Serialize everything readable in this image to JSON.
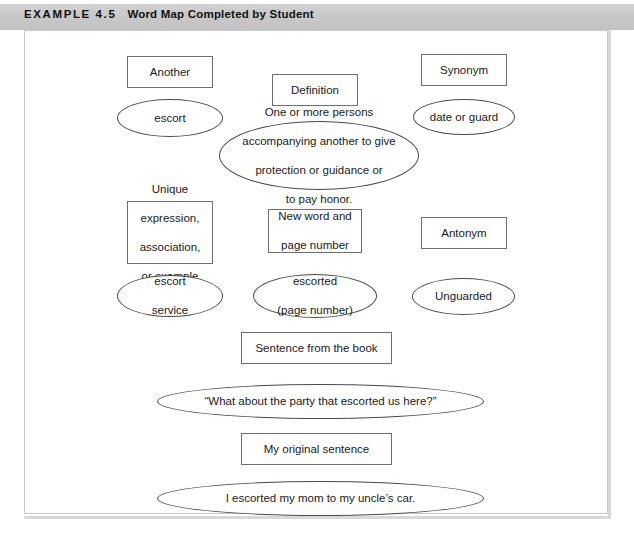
{
  "header": {
    "label": "EXAMPLE 4.5",
    "title": "Word Map Completed by Student"
  },
  "diagram": {
    "title": "Word Map Completed by Student",
    "nodes": [
      {
        "id": "another-box",
        "shape": "box",
        "text": "Another"
      },
      {
        "id": "another-answer",
        "shape": "ellipse",
        "text": "escort"
      },
      {
        "id": "definition-box",
        "shape": "box",
        "text": "Definition"
      },
      {
        "id": "definition-answer",
        "shape": "ellipse",
        "text": "One or more persons accompanying another to give protection or guidance or to pay honor.",
        "lines": [
          "One or more persons",
          "accompanying another to give",
          "protection or guidance or",
          "to pay honor."
        ]
      },
      {
        "id": "synonym-box",
        "shape": "box",
        "text": "Synonym"
      },
      {
        "id": "synonym-answer",
        "shape": "ellipse",
        "text": "date or guard"
      },
      {
        "id": "unique-box",
        "shape": "box",
        "text": "Unique expression, association, or example",
        "lines": [
          "Unique",
          "expression,",
          "association,",
          "or example"
        ]
      },
      {
        "id": "unique-answer",
        "shape": "ellipse",
        "text": "escort service",
        "lines": [
          "escort",
          "service"
        ]
      },
      {
        "id": "newword-box",
        "shape": "box",
        "text": "New word and page number",
        "lines": [
          "New word and",
          "page number"
        ]
      },
      {
        "id": "newword-answer",
        "shape": "ellipse",
        "text": "escorted (page number)",
        "lines": [
          "escorted",
          "(page number)"
        ]
      },
      {
        "id": "antonym-box",
        "shape": "box",
        "text": "Antonym"
      },
      {
        "id": "antonym-answer",
        "shape": "ellipse",
        "text": "Unguarded"
      },
      {
        "id": "book-sentence-box",
        "shape": "box",
        "text": "Sentence from the book"
      },
      {
        "id": "book-sentence-answer",
        "shape": "ellipse",
        "text": "“What about the party that escorted us here?”"
      },
      {
        "id": "original-sentence-box",
        "shape": "box",
        "text": "My original sentence"
      },
      {
        "id": "original-sentence-answer",
        "shape": "ellipse",
        "text": "I escorted my mom to my uncle’s car."
      }
    ]
  },
  "colors": {
    "header_background": "#c9c9c9",
    "header_text": "#111111",
    "panel_border": "#c9c9c9",
    "box_border": "#6f6f6f",
    "ellipse_border": "#4a4a4a",
    "shape_fill": "#ffffff",
    "node_text": "#1a1a1a"
  }
}
